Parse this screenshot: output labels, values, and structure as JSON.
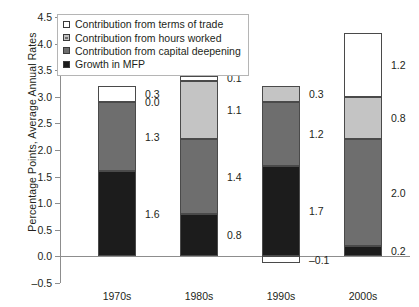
{
  "chart_data": {
    "type": "bar",
    "subtype": "stacked",
    "title": "",
    "xlabel": "",
    "ylabel": "Percentage Points, Average Annual Rates",
    "categories": [
      "1970s",
      "1980s",
      "1990s",
      "2000s"
    ],
    "ylim": [
      -0.5,
      4.5
    ],
    "ytick_step": 0.5,
    "yticks": [
      "4.5",
      "4.0",
      "3.5",
      "3.0",
      "2.5",
      "2.0",
      "1.5",
      "1.0",
      "0.5",
      "0.0",
      "-0.5"
    ],
    "ytick_values": [
      4.5,
      4.0,
      3.5,
      3.0,
      2.5,
      2.0,
      1.5,
      1.0,
      0.5,
      0.0,
      -0.5
    ],
    "grid": false,
    "legend_position": "top-left",
    "series": [
      {
        "name": "Growth in MFP",
        "color": "#1c1c1c",
        "values": [
          1.6,
          0.8,
          1.7,
          0.2
        ],
        "labels": [
          "1.6",
          "0.8",
          "1.7",
          "0.2"
        ]
      },
      {
        "name": "Contribution from capital deepening",
        "color": "#6e6e6e",
        "values": [
          1.3,
          1.4,
          1.2,
          2.0
        ],
        "labels": [
          "1.3",
          "1.4",
          "1.2",
          "2.0"
        ]
      },
      {
        "name": "Contribution from hours worked",
        "color": "#c4c4c4",
        "values": [
          0.0,
          1.1,
          0.3,
          0.8
        ],
        "labels": [
          "0.0",
          "1.1",
          "0.3",
          "0.8"
        ]
      },
      {
        "name": "Contribution from terms of trade",
        "color": "#ffffff",
        "values": [
          0.3,
          0.1,
          -0.1,
          1.2
        ],
        "labels": [
          "0.3",
          "0.1",
          "-0.1",
          "1.2"
        ]
      }
    ],
    "totals": [
      3.2,
      3.4,
      3.1,
      4.2
    ]
  },
  "legend": {
    "items": [
      {
        "label": "Contribution from terms of trade",
        "color": "#ffffff"
      },
      {
        "label": "Contribution from hours worked",
        "color": "#c4c4c4"
      },
      {
        "label": "Contribution from capital deepening",
        "color": "#6e6e6e"
      },
      {
        "label": "Growth in MFP",
        "color": "#1c1c1c"
      }
    ]
  }
}
